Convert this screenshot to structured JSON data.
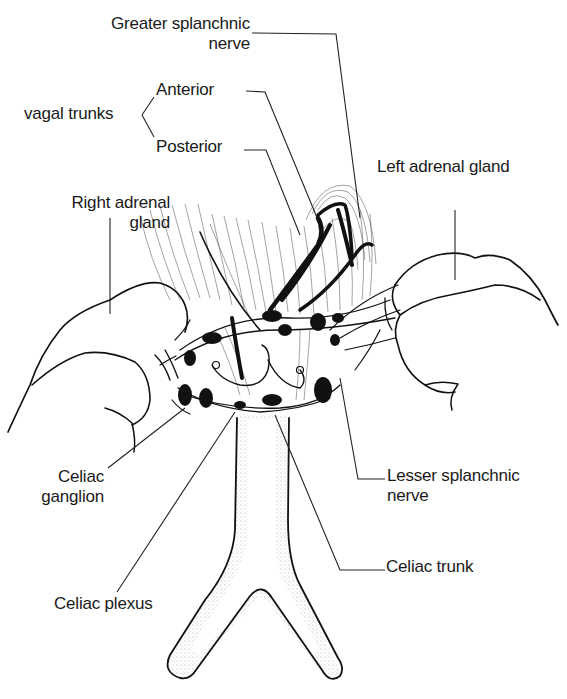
{
  "figure": {
    "colors": {
      "ink": "#111111",
      "background": "#ffffff",
      "stipple": "#555555"
    }
  },
  "labels": {
    "greater_splanchnic": {
      "line1": "Greater splanchnic",
      "line2": "nerve"
    },
    "vagal_trunks": {
      "group": "vagal trunks",
      "anterior": "Anterior",
      "posterior": "Posterior"
    },
    "left_adrenal": {
      "line1": "Left adrenal gland"
    },
    "right_adrenal": {
      "line1": "Right adrenal",
      "line2": "gland"
    },
    "celiac_ganglion": {
      "line1": "Celiac",
      "line2": "ganglion"
    },
    "lesser_splanchnic": {
      "line1": "Lesser splanchnic",
      "line2": "nerve"
    },
    "celiac_trunk": {
      "line1": "Celiac trunk"
    },
    "celiac_plexus": {
      "line1": "Celiac plexus"
    }
  }
}
